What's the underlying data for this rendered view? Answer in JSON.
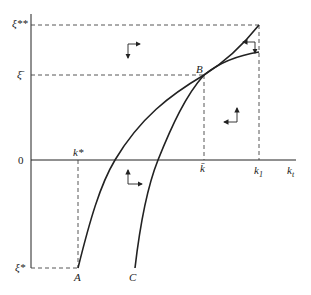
{
  "diagram": {
    "type": "phase-diagram",
    "axes": {
      "x_label": "k",
      "x_label_sub": "t",
      "origin_label": "0"
    },
    "y_labels": {
      "xi_double_star": "ξ**",
      "xi_bar": "ξ̄",
      "xi_star": "ξ*"
    },
    "x_labels": {
      "k_star": "k*",
      "k_bar": "k̄",
      "k1": "k",
      "k1_sub": "1"
    },
    "points": {
      "A": "A",
      "B": "B",
      "C": "C"
    },
    "curves": [
      {
        "name": "curve-A",
        "from": "A",
        "through": "B",
        "to_top": "ξ** at k1"
      },
      {
        "name": "curve-C",
        "from": "C",
        "through": "B",
        "to_top": "below ξ** at k1"
      }
    ],
    "arrows": [
      {
        "region": "upper-left",
        "directions": [
          "down",
          "right"
        ]
      },
      {
        "region": "upper-right-between-curves",
        "directions": [
          "down",
          "left"
        ]
      },
      {
        "region": "right-middle",
        "directions": [
          "up",
          "left"
        ]
      },
      {
        "region": "lower-middle",
        "directions": [
          "up",
          "right"
        ]
      }
    ],
    "colors": {
      "line": "#222222",
      "dashed": "#444444",
      "background": "#ffffff"
    }
  }
}
